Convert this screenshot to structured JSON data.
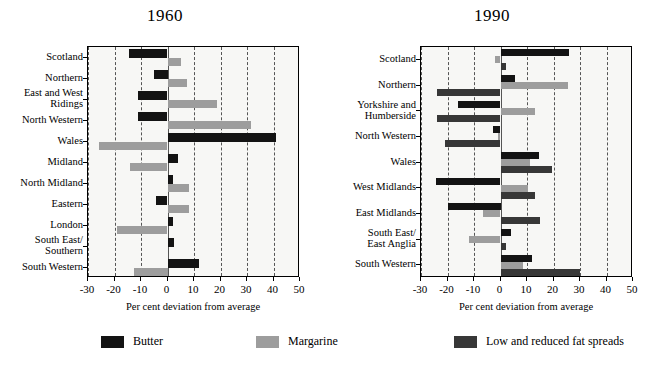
{
  "chart_data": [
    {
      "type": "bar",
      "title": "1960",
      "orientation": "horizontal",
      "xlabel": "Per cent deviation from average",
      "ylabel": "",
      "xlim": [
        -30,
        50
      ],
      "xticks": [
        -30,
        -20,
        -10,
        0,
        10,
        20,
        30,
        40,
        50
      ],
      "xticklabels": [
        "-30",
        "-20",
        "-10",
        "0",
        "10",
        "20",
        "30",
        "40",
        "50"
      ],
      "grid": true,
      "legend_position": "bottom",
      "categories": [
        "Scotland",
        "Northern",
        "East and West\nRidings",
        "North Western",
        "Wales",
        "Midland",
        "North Midland",
        "Eastern",
        "London",
        "South East/\nSouthern",
        "South Western"
      ],
      "series": [
        {
          "name": "Butter",
          "color": "#131313",
          "values": [
            -14.5,
            -5.0,
            -11.0,
            -11.0,
            41.0,
            4.0,
            2.0,
            -4.5,
            2.0,
            2.5,
            12.0
          ]
        },
        {
          "name": "Margarine",
          "color": "#9d9d9d",
          "values": [
            5.0,
            7.5,
            18.5,
            31.5,
            -26.0,
            -14.0,
            8.0,
            8.0,
            -19.0,
            0.0,
            -12.5
          ]
        }
      ]
    },
    {
      "type": "bar",
      "title": "1990",
      "orientation": "horizontal",
      "xlabel": "Per cent deviation from average",
      "ylabel": "",
      "xlim": [
        -30,
        50
      ],
      "xticks": [
        -30,
        -20,
        -10,
        0,
        10,
        20,
        30,
        40,
        50
      ],
      "xticklabels": [
        "-30",
        "-20",
        "-10",
        "0",
        "10",
        "20",
        "30",
        "40",
        "50"
      ],
      "grid": true,
      "legend_position": "bottom",
      "categories": [
        "Scotland",
        "Northern",
        "Yorkshire and\nHumberside",
        "North Western",
        "Wales",
        "West Midlands",
        "East Midlands",
        "South East/\nEast Anglia",
        "South Western"
      ],
      "series": [
        {
          "name": "Butter",
          "color": "#131313",
          "values": [
            26.0,
            5.5,
            -16.0,
            -3.0,
            14.5,
            -24.5,
            -20.0,
            4.0,
            12.0
          ]
        },
        {
          "name": "Margarine",
          "color": "#9d9d9d",
          "values": [
            -2.0,
            25.5,
            13.0,
            -1.0,
            11.0,
            10.5,
            -6.5,
            -12.0,
            8.5
          ]
        },
        {
          "name": "Low and reduced fat spreads",
          "color": "#373737",
          "values": [
            2.0,
            -24.0,
            -24.0,
            -21.0,
            19.5,
            13.0,
            15.0,
            2.0,
            30.0
          ]
        }
      ]
    }
  ],
  "legend": {
    "items": [
      {
        "label": "Butter",
        "color": "#131313",
        "swatch_name": "legend-swatch-butter"
      },
      {
        "label": "Margarine",
        "color": "#9d9d9d",
        "swatch_name": "legend-swatch-margarine"
      },
      {
        "label": "Low and reduced fat spreads",
        "color": "#373737",
        "swatch_name": "legend-swatch-low-fat"
      }
    ]
  }
}
